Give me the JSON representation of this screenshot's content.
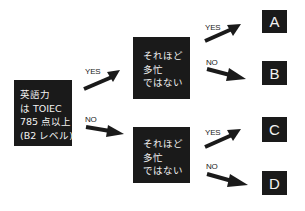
{
  "root": {
    "lines": [
      "英語力",
      "は TOIEC",
      "785 点以上",
      "(B2 レベル)"
    ]
  },
  "middle_top": {
    "lines": [
      "それほど",
      "多忙",
      "ではない"
    ]
  },
  "middle_bottom": {
    "lines": [
      "それほど",
      "多忙",
      "ではない"
    ]
  },
  "edges": {
    "root_yes": "YES",
    "root_no": "NO",
    "top_yes": "YES",
    "top_no": "NO",
    "bottom_yes": "YES",
    "bottom_no": "NO"
  },
  "outcomes": {
    "a": "A",
    "b": "B",
    "c": "C",
    "d": "D"
  },
  "colors": {
    "box": "#1a1a1a",
    "box_text": "#f2f2f2",
    "arrow": "#1a1a1a"
  }
}
